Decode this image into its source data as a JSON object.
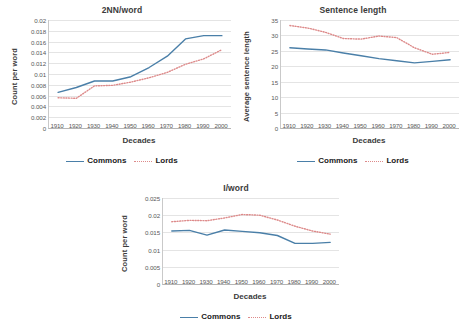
{
  "figure": {
    "background": "#ffffff",
    "series_colors": {
      "commons": "#4a7fa8",
      "lords": "#dd8a8a"
    },
    "legend": {
      "commons": "Commons",
      "lords": "Lords"
    }
  },
  "chart_data": [
    {
      "type": "line",
      "title": "2NN/word",
      "xlabel": "Decades",
      "ylabel": "Count per word",
      "categories": [
        "1910",
        "1920",
        "1930",
        "1940",
        "1950",
        "1960",
        "1970",
        "1980",
        "1990",
        "2000"
      ],
      "ylim": [
        0,
        0.02
      ],
      "yticks": [
        0,
        0.002,
        0.004,
        0.006,
        0.008,
        0.01,
        0.012,
        0.014,
        0.016,
        0.018,
        0.02
      ],
      "ytick_labels": [
        "0",
        "0.002",
        "0.004",
        "0.006",
        "0.008",
        "0.01",
        "0.012",
        "0.014",
        "0.016",
        "0.018",
        "0.02"
      ],
      "grid": true,
      "legend_position": "bottom",
      "series": [
        {
          "name": "Commons",
          "style": "solid",
          "color": "#4a7fa8",
          "values": [
            0.0066,
            0.0075,
            0.0087,
            0.0087,
            0.0095,
            0.0112,
            0.0133,
            0.0165,
            0.0171,
            0.0171
          ]
        },
        {
          "name": "Lords",
          "style": "dotted",
          "color": "#dd8a8a",
          "values": [
            0.0056,
            0.0055,
            0.0078,
            0.0079,
            0.0085,
            0.0093,
            0.0103,
            0.0118,
            0.0128,
            0.0145
          ]
        }
      ]
    },
    {
      "type": "line",
      "title": "Sentence length",
      "xlabel": "Decades",
      "ylabel": "Average sentence length",
      "categories": [
        "1910",
        "1920",
        "1930",
        "1940",
        "1950",
        "1960",
        "1970",
        "1980",
        "1990",
        "2000"
      ],
      "ylim": [
        0,
        35
      ],
      "yticks": [
        0,
        5,
        10,
        15,
        20,
        25,
        30,
        35
      ],
      "ytick_labels": [
        "0",
        "5",
        "10",
        "15",
        "20",
        "25",
        "30",
        "35"
      ],
      "grid": true,
      "legend_position": "bottom",
      "series": [
        {
          "name": "Commons",
          "style": "solid",
          "color": "#4a7fa8",
          "values": [
            26.0,
            25.6,
            25.3,
            24.3,
            23.4,
            22.5,
            21.8,
            21.1,
            21.6,
            22.1
          ]
        },
        {
          "name": "Lords",
          "style": "dotted",
          "color": "#dd8a8a",
          "values": [
            33.2,
            32.4,
            31.0,
            29.0,
            28.8,
            29.8,
            29.3,
            26.0,
            23.9,
            24.5
          ]
        }
      ]
    },
    {
      "type": "line",
      "title": "I/word",
      "xlabel": "Decades",
      "ylabel": "Count per word",
      "categories": [
        "1910",
        "1920",
        "1930",
        "1940",
        "1950",
        "1960",
        "1970",
        "1980",
        "1990",
        "2000"
      ],
      "ylim": [
        0,
        0.025
      ],
      "yticks": [
        0,
        0.005,
        0.01,
        0.015,
        0.02,
        0.025
      ],
      "ytick_labels": [
        "0",
        "0.005",
        "0.01",
        "0.015",
        "0.02",
        "0.025"
      ],
      "grid": true,
      "legend_position": "bottom",
      "series": [
        {
          "name": "Commons",
          "style": "solid",
          "color": "#4a7fa8",
          "values": [
            0.0154,
            0.0156,
            0.0142,
            0.0157,
            0.0153,
            0.0149,
            0.0141,
            0.0118,
            0.0118,
            0.0121
          ]
        },
        {
          "name": "Lords",
          "style": "dotted",
          "color": "#dd8a8a",
          "values": [
            0.0181,
            0.0185,
            0.0184,
            0.0192,
            0.0202,
            0.02,
            0.0186,
            0.0168,
            0.0154,
            0.0145
          ]
        }
      ]
    }
  ]
}
